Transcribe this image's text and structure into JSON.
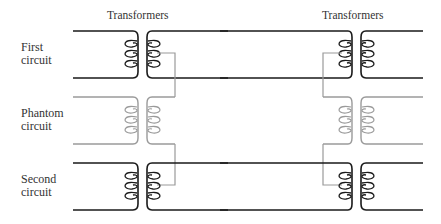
{
  "diagram": {
    "type": "phantom-circuit-schematic",
    "transformer_labels": {
      "left": "Transformers",
      "right": "Transformers"
    },
    "circuits": [
      {
        "id": "first",
        "line1": "First",
        "line2": "circuit",
        "color": "#1a1a1a"
      },
      {
        "id": "phantom",
        "line1": "Phantom",
        "line2": "circuit",
        "color": "#9a9a9a"
      },
      {
        "id": "second",
        "line1": "Second",
        "line2": "circuit",
        "color": "#1a1a1a"
      }
    ],
    "colors": {
      "primary_line": "#1a1a1a",
      "phantom_line": "#9a9a9a",
      "background": "#ffffff"
    }
  }
}
